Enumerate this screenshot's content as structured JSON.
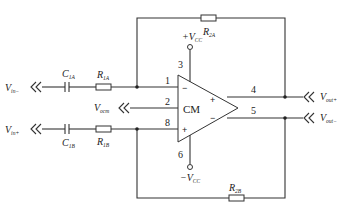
{
  "diagram": {
    "type": "fully-differential amplifier circuit",
    "amplifier": {
      "label": "CM",
      "input_signs": {
        "top": "−",
        "bottom": "+"
      },
      "output_signs": {
        "top": "+",
        "bottom": "−"
      }
    },
    "pins": {
      "p1": "1",
      "p2": "2",
      "p3": "3",
      "p4": "4",
      "p5": "5",
      "p6": "6",
      "p8": "8"
    },
    "supplies": {
      "positive": {
        "prefix": "+V",
        "sub": "CC"
      },
      "negative": {
        "prefix": "−V",
        "sub": "CC"
      }
    },
    "components": {
      "c1a": {
        "main": "C",
        "sub": "1A"
      },
      "c1b": {
        "main": "C",
        "sub": "1B"
      },
      "r1a": {
        "main": "R",
        "sub": "1A"
      },
      "r1b": {
        "main": "R",
        "sub": "1B"
      },
      "r2a": {
        "main": "R",
        "sub": "2A"
      },
      "r2b": {
        "main": "R",
        "sub": "2B"
      }
    },
    "terminals": {
      "vin_minus": {
        "main": "V",
        "sub": "in−"
      },
      "vin_plus": {
        "main": "V",
        "sub": "in+"
      },
      "vocm": {
        "main": "V",
        "sub": "ocm"
      },
      "vout_plus": {
        "main": "V",
        "sub": "out+"
      },
      "vout_minus": {
        "main": "V",
        "sub": "out−"
      }
    },
    "colors": {
      "line": "#333333",
      "background": "#ffffff"
    }
  }
}
